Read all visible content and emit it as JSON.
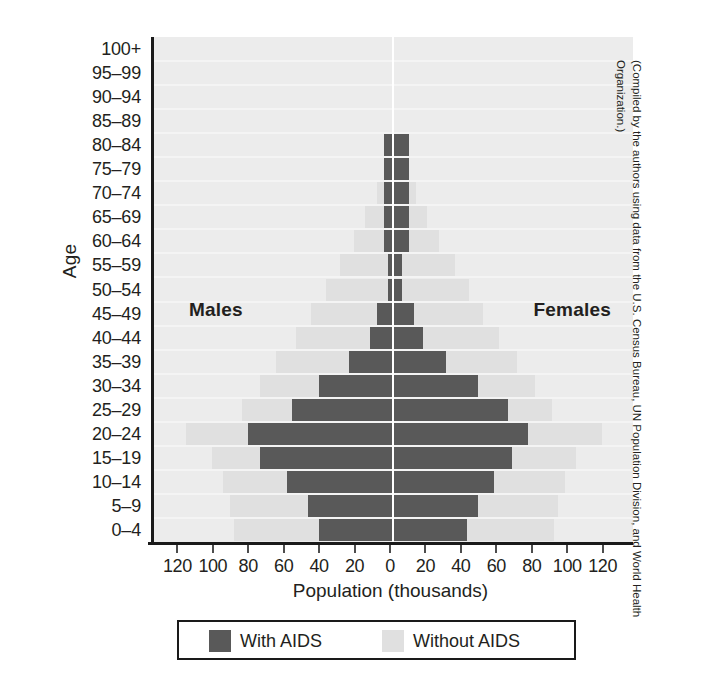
{
  "chart_data": {
    "type": "bar",
    "subtype": "population-pyramid",
    "title": "",
    "xlabel": "Population (thousands)",
    "ylabel": "Age",
    "xlim": [
      -130,
      130
    ],
    "xticks": [
      120,
      100,
      80,
      60,
      40,
      20,
      0,
      20,
      40,
      60,
      80,
      100,
      120
    ],
    "grid": true,
    "legend_position": "bottom",
    "side_labels": {
      "left": "Males",
      "right": "Females"
    },
    "categories": [
      "100+",
      "95–99",
      "90–94",
      "85–89",
      "80–84",
      "75–79",
      "70–74",
      "65–69",
      "60–64",
      "55–59",
      "50–54",
      "45–49",
      "40–44",
      "35–39",
      "30–34",
      "25–29",
      "20–24",
      "15–19",
      "10–14",
      "5–9",
      "0–4"
    ],
    "series": [
      {
        "name": "With AIDS",
        "side": "male",
        "color": "#595959",
        "values": [
          0,
          0,
          0,
          0,
          5,
          5,
          5,
          5,
          5,
          3,
          3,
          9,
          13,
          25,
          42,
          57,
          82,
          75,
          60,
          48,
          42
        ]
      },
      {
        "name": "Without AIDS",
        "side": "male",
        "color": "#e0e0e0",
        "values": [
          0,
          0,
          0,
          0,
          5,
          5,
          9,
          16,
          22,
          30,
          38,
          46,
          55,
          66,
          75,
          85,
          117,
          102,
          96,
          92,
          90
        ]
      },
      {
        "name": "With AIDS",
        "side": "female",
        "color": "#595959",
        "values": [
          0,
          0,
          0,
          0,
          9,
          9,
          9,
          9,
          9,
          5,
          5,
          12,
          17,
          30,
          48,
          65,
          76,
          67,
          57,
          48,
          42
        ]
      },
      {
        "name": "Without AIDS",
        "side": "female",
        "color": "#e0e0e0",
        "values": [
          0,
          0,
          0,
          0,
          9,
          9,
          13,
          19,
          26,
          35,
          43,
          51,
          60,
          70,
          80,
          90,
          118,
          103,
          97,
          93,
          91
        ]
      }
    ]
  },
  "axes": {
    "y_title": "Age",
    "x_title": "Population (thousands)",
    "y_tick_labels": [
      "100+",
      "95–99",
      "90–94",
      "85–89",
      "80–84",
      "75–79",
      "70–74",
      "65–69",
      "60–64",
      "55–59",
      "50–54",
      "45–49",
      "40–44",
      "35–39",
      "30–34",
      "25–29",
      "20–24",
      "15–19",
      "10–14",
      "5–9",
      "0–4"
    ],
    "x_tick_labels": [
      "120",
      "100",
      "80",
      "60",
      "40",
      "20",
      "0",
      "20",
      "40",
      "60",
      "80",
      "100",
      "120"
    ]
  },
  "annotations": {
    "males": "Males",
    "females": "Females"
  },
  "legend": {
    "items": [
      {
        "label": "With AIDS",
        "color": "#595959"
      },
      {
        "label": "Without AIDS",
        "color": "#e0e0e0"
      }
    ]
  },
  "source_note": "(Compiled by the authors using data from the U.S. Census Bureau, UN Population Division, and World Health Organization.)",
  "colors": {
    "with_aids": "#595959",
    "without_aids": "#e0e0e0",
    "plot_background": "#ececec",
    "axis": "#1a1a1a",
    "text": "#231f20",
    "gridline": "#c9c9c9",
    "center_line": "#ffffff"
  }
}
